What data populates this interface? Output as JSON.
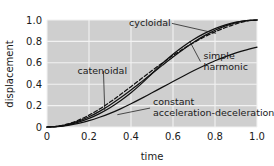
{
  "chart_data": {
    "type": "line",
    "title": "",
    "xlabel": "time",
    "ylabel": "displacement",
    "xlim": [
      0,
      1
    ],
    "ylim": [
      0,
      1
    ],
    "grid": true,
    "legend_position": "inline-annotations",
    "xticks": [
      "0",
      "0.2",
      "0.4",
      "0.6",
      "0.8",
      "1.0"
    ],
    "xtick_values": [
      0,
      0.2,
      0.4,
      0.6,
      0.8,
      1.0
    ],
    "yticks": [
      "0",
      "0.2",
      "0.4",
      "0.6",
      "0.8",
      "1.0"
    ],
    "ytick_values": [
      0,
      0.2,
      0.4,
      0.6,
      0.8,
      1.0
    ],
    "x": [
      0,
      0.05,
      0.1,
      0.15,
      0.2,
      0.25,
      0.3,
      0.35,
      0.4,
      0.45,
      0.5,
      0.55,
      0.6,
      0.65,
      0.7,
      0.75,
      0.8,
      0.85,
      0.9,
      0.95,
      1.0
    ],
    "series": [
      {
        "name": "cycloidal",
        "style": "solid",
        "color": "#101010",
        "values": [
          0.0,
          0.0041,
          0.0156,
          0.0342,
          0.0592,
          0.0908,
          0.1273,
          0.1699,
          0.2171,
          0.2674,
          0.32,
          0.3722,
          0.4251,
          0.4771,
          0.5275,
          0.5746,
          0.6189,
          0.6582,
          0.6928,
          0.7214,
          0.7455
        ]
      },
      {
        "name": "simple harmonic",
        "style": "solid",
        "color": "#101010",
        "values": [
          0.0,
          0.0062,
          0.0245,
          0.0545,
          0.0955,
          0.1464,
          0.2061,
          0.273,
          0.3455,
          0.4218,
          0.5,
          0.5782,
          0.6545,
          0.727,
          0.7939,
          0.8536,
          0.9045,
          0.9455,
          0.9755,
          0.9938,
          1.0
        ]
      },
      {
        "name": "catenoidal",
        "style": "dashed",
        "color": "#101010",
        "values": [
          0.0,
          0.0073,
          0.0289,
          0.0639,
          0.1108,
          0.1677,
          0.2326,
          0.3032,
          0.3772,
          0.4525,
          0.5271,
          0.5994,
          0.668,
          0.7319,
          0.7904,
          0.843,
          0.8895,
          0.9298,
          0.9639,
          0.9905,
          1.0
        ]
      },
      {
        "name": "constant acceleration-deceleration",
        "style": "solid",
        "color": "#101010",
        "values": [
          0.0,
          0.005,
          0.02,
          0.045,
          0.08,
          0.125,
          0.18,
          0.245,
          0.32,
          0.405,
          0.5,
          0.595,
          0.68,
          0.755,
          0.82,
          0.875,
          0.92,
          0.955,
          0.98,
          0.995,
          1.0
        ]
      }
    ],
    "annotations": [
      {
        "label": "cycloidal",
        "text_x": 0.49,
        "text_y": 0.945,
        "anchor": "middle",
        "leader_to_x": 0.805,
        "leader_to_y": 0.875
      },
      {
        "label_lines": [
          "simple",
          "harmonic"
        ],
        "text_x": 0.745,
        "text_y": 0.64,
        "anchor": "start",
        "leader_to_x": 0.68,
        "leader_to_y": 0.8
      },
      {
        "label": "catenoidal",
        "text_x": 0.145,
        "text_y": 0.5,
        "anchor": "start",
        "leader_to_x": 0.275,
        "leader_to_y": 0.155
      },
      {
        "label_lines": [
          "constant",
          "acceleration-deceleration"
        ],
        "text_x": 0.505,
        "text_y": 0.205,
        "anchor": "start",
        "leader_to_x": 0.335,
        "leader_to_y": 0.115
      }
    ],
    "colors": {
      "plot_background": "#cfcfcf",
      "figure_background": "#ffffff",
      "gridline": "#f2f2f2",
      "line": "#101010",
      "text": "#1a1a1a"
    }
  }
}
